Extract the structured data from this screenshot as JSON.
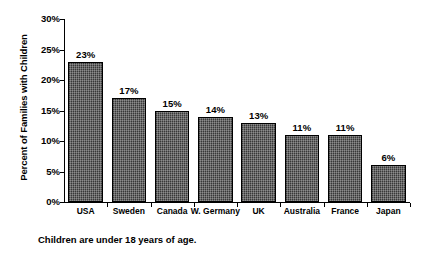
{
  "chart_data": {
    "type": "bar",
    "title": "",
    "subtitle": "",
    "xlabel": "",
    "ylabel": "Percent of Families with Children",
    "categories": [
      "USA",
      "Sweden",
      "Canada",
      "W. Germany",
      "UK",
      "Australia",
      "France",
      "Japan"
    ],
    "values": [
      23,
      17,
      15,
      14,
      13,
      11,
      11,
      6
    ],
    "value_labels": [
      "23%",
      "17%",
      "15%",
      "14%",
      "13%",
      "11%",
      "11%",
      "6%"
    ],
    "ylim": [
      0,
      30
    ],
    "ytick_values": [
      0,
      5,
      10,
      15,
      20,
      25,
      30
    ],
    "ytick_labels": [
      "0%",
      "5%",
      "10%",
      "15%",
      "20%",
      "25%",
      "30%"
    ],
    "grid": false,
    "legend": "none",
    "series": [
      {
        "name": "Percent of families with children",
        "values": [
          23,
          17,
          15,
          14,
          13,
          11,
          11,
          6
        ]
      }
    ],
    "bar_fill_color": "#5a5a5a",
    "bar_edge_color": "#000000",
    "background_color": "#ffffff",
    "annotations": [
      "Children are under 18 years of age."
    ]
  },
  "caption": {
    "text": "Children are under 18 years of age."
  }
}
